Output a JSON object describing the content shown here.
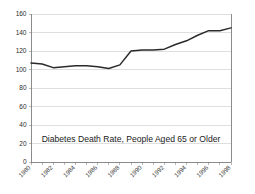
{
  "chart_data": {
    "type": "line",
    "title": "",
    "annotation": "Diabetes Death Rate, People Aged 65 or Older",
    "xlabel": "",
    "ylabel": "",
    "ylim": [
      0,
      160
    ],
    "ytick_values": [
      0,
      20,
      40,
      60,
      80,
      100,
      120,
      140,
      160
    ],
    "ytick_labels": [
      "0",
      "20",
      "40",
      "60",
      "80",
      "100",
      "120",
      "140",
      "160"
    ],
    "xlim": [
      1980,
      1998
    ],
    "xtick_labels": [
      "1980",
      "1982",
      "1984",
      "1986",
      "1988",
      "1990",
      "1992",
      "1994",
      "1996",
      "1998"
    ],
    "xtick_label_rotation": -45,
    "x_minor_ticks_every": 1,
    "grid": "horizontal",
    "legend": "none",
    "line_color": "#2a2a2a",
    "grid_color": "#c9c9c9",
    "axis_color": "#6e6e6e",
    "background_color": "#ffffff",
    "x": [
      1980,
      1981,
      1982,
      1983,
      1984,
      1985,
      1986,
      1987,
      1988,
      1989,
      1990,
      1991,
      1992,
      1993,
      1994,
      1995,
      1996,
      1997,
      1998
    ],
    "values": [
      107,
      106,
      102,
      103,
      104,
      104,
      103,
      101,
      105,
      120,
      121,
      121,
      122,
      127,
      131,
      137,
      142,
      142,
      145
    ],
    "series": [
      {
        "name": "Diabetes Death Rate, People Aged 65 or Older",
        "values": [
          107,
          106,
          102,
          103,
          104,
          104,
          103,
          101,
          105,
          120,
          121,
          121,
          122,
          127,
          131,
          137,
          142,
          142,
          145
        ]
      }
    ]
  }
}
